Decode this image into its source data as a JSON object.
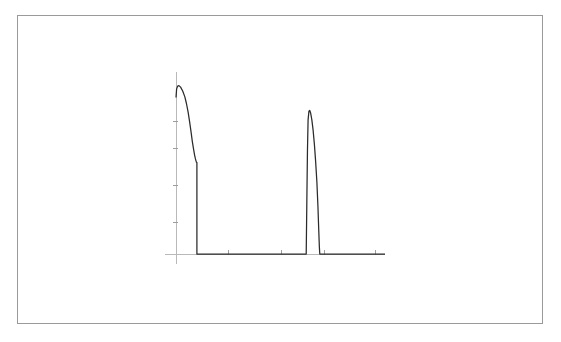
{
  "figure": {
    "title": "",
    "subtitle": "",
    "background_color": "#ffffff",
    "frame": {
      "name": "outer-border",
      "x": 17,
      "y": 15,
      "width": 526,
      "height": 309,
      "stroke_color": "#9a9a9a",
      "stroke_width": 1
    }
  },
  "chart_data": {
    "type": "line",
    "title": "",
    "subtitle": "",
    "xlabel": "",
    "ylabel": "",
    "grid": false,
    "legend": null,
    "legend_position": "none",
    "annotations": [],
    "xtick_labels": [],
    "ytick_labels": [],
    "line_color": "#2b2b2b",
    "line_width": 1.25,
    "axis_color": "#b9b9b9",
    "tick_color": "#9e9e9e",
    "xlim": [
      0,
      100
    ],
    "ylim": [
      0,
      100
    ],
    "series": [
      {
        "name": "signal",
        "color": "#2b2b2b",
        "points": [
          [
            0.0,
            91.0
          ],
          [
            0.3,
            96.0
          ],
          [
            0.8,
            97.6
          ],
          [
            1.4,
            97.9
          ],
          [
            2.2,
            97.0
          ],
          [
            3.2,
            94.8
          ],
          [
            4.2,
            91.5
          ],
          [
            5.0,
            87.5
          ],
          [
            5.8,
            82.5
          ],
          [
            6.5,
            77.0
          ],
          [
            7.2,
            71.0
          ],
          [
            7.8,
            65.5
          ],
          [
            8.4,
            61.0
          ],
          [
            8.9,
            57.5
          ],
          [
            9.3,
            55.3
          ],
          [
            9.6,
            54.0
          ],
          [
            9.8,
            53.4
          ],
          [
            10.0,
            53.2
          ],
          [
            10.0,
            0.0
          ],
          [
            15.0,
            0.0
          ],
          [
            25.0,
            0.0
          ],
          [
            35.0,
            0.0
          ],
          [
            45.0,
            0.0
          ],
          [
            55.0,
            0.0
          ],
          [
            60.0,
            0.0
          ],
          [
            62.0,
            0.0
          ],
          [
            62.3,
            0.0
          ],
          [
            62.6,
            30.0
          ],
          [
            62.9,
            60.0
          ],
          [
            63.2,
            78.0
          ],
          [
            63.6,
            83.0
          ],
          [
            64.0,
            83.5
          ],
          [
            64.4,
            82.0
          ],
          [
            65.0,
            78.0
          ],
          [
            65.6,
            72.0
          ],
          [
            66.2,
            64.0
          ],
          [
            66.8,
            54.0
          ],
          [
            67.4,
            42.0
          ],
          [
            67.9,
            28.0
          ],
          [
            68.3,
            14.0
          ],
          [
            68.6,
            4.0
          ],
          [
            68.8,
            0.0
          ],
          [
            75.0,
            0.0
          ],
          [
            85.0,
            0.0
          ],
          [
            95.0,
            0.0
          ],
          [
            100.0,
            0.0
          ]
        ]
      }
    ],
    "axes": {
      "y_axis": {
        "name": "y-axis",
        "x_px": 176,
        "y_top_px": 72,
        "y_bottom_px": 264,
        "tick_positions_px": [
          121,
          148,
          185,
          222
        ]
      },
      "x_axis": {
        "name": "x-axis",
        "y_px": 254,
        "x_left_px": 165,
        "x_right_px": 385,
        "tick_positions_px": [
          228,
          281,
          324,
          375
        ]
      }
    },
    "baseline_px": 254,
    "plot_left_px": 176,
    "plot_right_px": 385,
    "plot_top_px": 82,
    "peaks": [
      {
        "name": "primary-peak",
        "apex_x_px": 178,
        "apex_y_px": 87,
        "width_px": 11,
        "shape": "broad-decaying"
      },
      {
        "name": "secondary-peak",
        "apex_x_px": 313,
        "apex_y_px": 103,
        "width_px": 9,
        "shape": "narrow-spike"
      }
    ]
  }
}
